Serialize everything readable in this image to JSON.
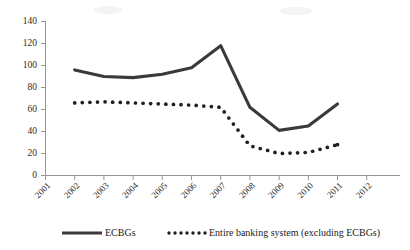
{
  "chart_data": {
    "type": "line",
    "title": "",
    "subtitle": "",
    "xlabel": "",
    "ylabel": "",
    "x": [
      2001,
      2002,
      2003,
      2004,
      2005,
      2006,
      2007,
      2008,
      2009,
      2010,
      2011,
      2012
    ],
    "xticklabels": [
      "2001",
      "2002",
      "2003",
      "2004",
      "2005",
      "2006",
      "2007",
      "2008",
      "2009",
      "2010",
      "2011",
      "2012"
    ],
    "yticklabels": [
      "0",
      "20",
      "40",
      "60",
      "80",
      "100",
      "120",
      "140"
    ],
    "yticks": [
      0,
      20,
      40,
      60,
      80,
      100,
      120,
      140
    ],
    "ylim": [
      0,
      140
    ],
    "xlim": [
      2001,
      2012
    ],
    "grid": false,
    "legend_position": "bottom",
    "series": [
      {
        "name": "ECBGs",
        "style": "solid",
        "color": "#3a3a3a",
        "x": [
          2002,
          2003,
          2004,
          2005,
          2006,
          2007,
          2008,
          2009,
          2010,
          2011
        ],
        "values": [
          96,
          90,
          89,
          92,
          98,
          118,
          62,
          41,
          45,
          65
        ]
      },
      {
        "name": "Entire banking system (excluding ECBGs)",
        "style": "dotted",
        "color": "#1f1f1f",
        "x": [
          2002,
          2003,
          2004,
          2005,
          2006,
          2007,
          2008,
          2009,
          2010,
          2011
        ],
        "values": [
          66,
          67,
          66,
          65,
          64,
          62,
          27,
          20,
          21,
          28
        ]
      }
    ]
  },
  "legend": {
    "items": [
      {
        "label": "ECBGs",
        "marker": "solid-line"
      },
      {
        "label": "Entire banking system (excluding ECBGs)",
        "marker": "dotted-line"
      }
    ]
  },
  "colors": {
    "solid_series": "#3a3a3a",
    "dotted_series": "#1f1f1f",
    "axis": "#8a8a8a",
    "background": "#ffffff"
  }
}
